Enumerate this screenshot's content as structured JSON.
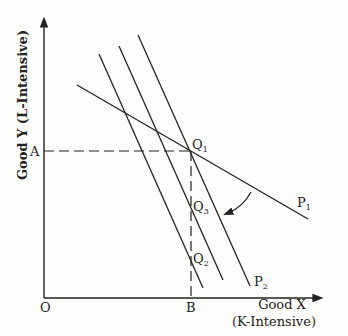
{
  "diagram": {
    "y_axis_label": "Good Y (L-Intensive)",
    "x_axis_label_line1": "Good X",
    "x_axis_label_line2": "(K-Intensive)",
    "origin_label": "O",
    "point_a_label": "A",
    "point_b_label": "B",
    "q1_label": "Q",
    "q1_sub": "1",
    "q2_label": "Q",
    "q2_sub": "2",
    "q3_label": "Q",
    "q3_sub": "3",
    "p1_label": "P",
    "p1_sub": "1",
    "p2_label": "P",
    "p2_sub": "2",
    "line_color": "#222222",
    "background": "#fdfdfb"
  }
}
